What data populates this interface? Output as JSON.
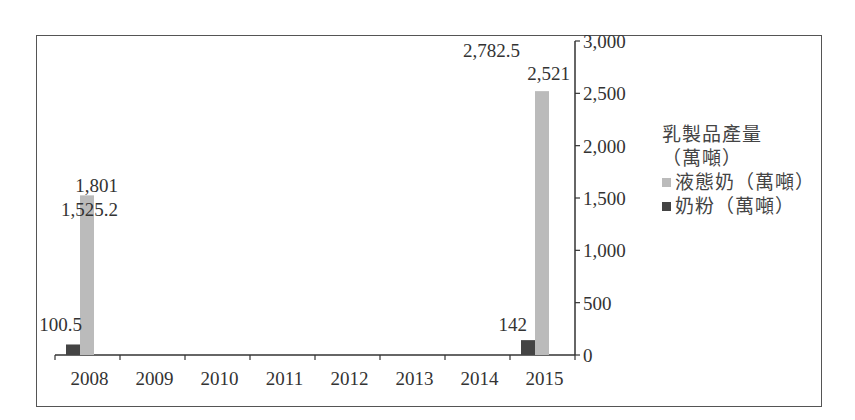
{
  "chart_data": {
    "type": "bar",
    "title": "",
    "xlabel": "",
    "ylabel": "",
    "categories": [
      "2008",
      "2009",
      "2010",
      "2011",
      "2012",
      "2013",
      "2014",
      "2015"
    ],
    "series": [
      {
        "name": "奶粉（萬噸）",
        "color": "#444444",
        "values": [
          100.5,
          null,
          null,
          null,
          null,
          null,
          null,
          142
        ]
      },
      {
        "name": "液態奶（萬噸）",
        "color": "#bbbbbb",
        "values": [
          1525.2,
          null,
          null,
          null,
          null,
          null,
          null,
          2521
        ]
      }
    ],
    "extra_series": [
      {
        "name": "乳製品產量（萬噸）",
        "values": [
          1801,
          null,
          null,
          null,
          null,
          null,
          null,
          2782.5
        ]
      }
    ],
    "data_labels": {
      "2008": [
        "1,801",
        "1,525.2",
        "100.5"
      ],
      "2015": [
        "2,782.5",
        "2,521",
        "142"
      ]
    },
    "ylim": [
      0,
      3000
    ],
    "yticks": [
      "0",
      "500",
      "1,000",
      "1,500",
      "2,000",
      "2,500",
      "3,000"
    ],
    "y_axis_position": "right",
    "grid": false,
    "legend_position": "right"
  },
  "legend": {
    "title_line1": "乳製品產量",
    "title_line2": "（萬噸）",
    "items": [
      {
        "label": "液態奶（萬噸）",
        "color": "#bbbbbb"
      },
      {
        "label": "奶粉（萬噸）",
        "color": "#444444"
      }
    ]
  }
}
